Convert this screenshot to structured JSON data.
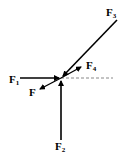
{
  "diagram": {
    "type": "force-diagram",
    "labels": {
      "F1": {
        "base": "F",
        "sub": "1"
      },
      "F2": {
        "base": "F",
        "sub": "2"
      },
      "F3": {
        "base": "F",
        "sub": "3"
      },
      "F4": {
        "base": "F",
        "sub": "4"
      },
      "F": {
        "base": "F",
        "sub": ""
      }
    },
    "colors": {
      "line": "#000000",
      "dashed": "#888888"
    }
  }
}
